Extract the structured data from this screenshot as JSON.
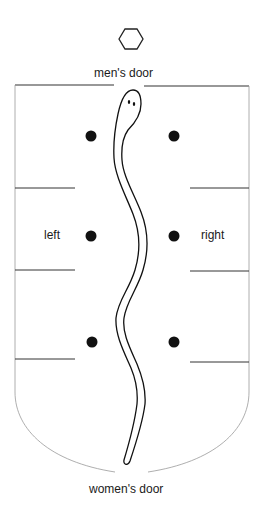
{
  "diagram": {
    "type": "floor-plan",
    "labels": {
      "top_door": "men's door",
      "bottom_door": "women's door",
      "left": "left",
      "right": "right"
    },
    "symbols": {
      "top_marker": "hexagon",
      "figure": "snake",
      "markers": "dot"
    },
    "dots": [
      {
        "side": "left",
        "row": 1
      },
      {
        "side": "right",
        "row": 1
      },
      {
        "side": "left",
        "row": 2
      },
      {
        "side": "right",
        "row": 2
      },
      {
        "side": "left",
        "row": 3
      },
      {
        "side": "right",
        "row": 3
      }
    ],
    "colors": {
      "ink": "#111111",
      "wall": "#888888",
      "background": "#ffffff"
    }
  }
}
